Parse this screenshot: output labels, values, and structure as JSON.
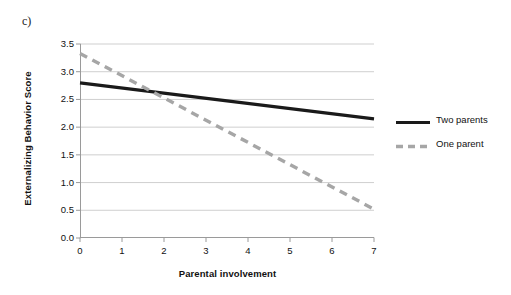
{
  "panel": {
    "label": "c)"
  },
  "chart_data": {
    "type": "line",
    "title": "",
    "subtitle": "",
    "xlabel": "Parental involvement",
    "ylabel": "Externalizing Behavior Score",
    "xlim": [
      0,
      7
    ],
    "ylim": [
      0.0,
      3.5
    ],
    "xticks": [
      "0",
      "1",
      "2",
      "3",
      "4",
      "5",
      "6",
      "7"
    ],
    "yticks": [
      "0.0",
      "0.5",
      "1.0",
      "1.5",
      "2.0",
      "2.5",
      "3.0",
      "3.5"
    ],
    "grid": "horizontal",
    "legend_position": "right",
    "x": [
      0,
      7
    ],
    "series": [
      {
        "name": "Two parents",
        "values": [
          2.8,
          2.15
        ],
        "style": "solid",
        "color": "#1a1a1a",
        "width": 3.2
      },
      {
        "name": "One parent",
        "values": [
          3.33,
          0.52
        ],
        "style": "dashed",
        "color": "#a6a6a6",
        "width": 3.4
      }
    ]
  },
  "legend": {
    "entries": [
      {
        "label": "Two parents"
      },
      {
        "label": "One parent"
      }
    ]
  },
  "colors": {
    "two_parents_line": "#1a1a1a",
    "one_parent_line": "#a6a6a6",
    "gridline": "#c9c9c9",
    "axis": "#9a9a9a",
    "text": "#111111",
    "background": "#ffffff"
  }
}
